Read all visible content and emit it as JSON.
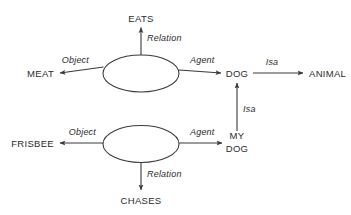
{
  "diagram": {
    "type": "semantic-network",
    "title": "",
    "background_color": "#ffffff",
    "line_color": "#3a3a3a",
    "text_color": "#2b2b2b",
    "nodes": [
      {
        "id": "eats",
        "label": "EATS",
        "kind": "concept",
        "x": 141,
        "y": 18
      },
      {
        "id": "meat",
        "label": "MEAT",
        "kind": "concept",
        "x": 40,
        "y": 73
      },
      {
        "id": "prop1",
        "label": "",
        "kind": "proposition",
        "x": 141,
        "y": 73
      },
      {
        "id": "dog",
        "label": "DOG",
        "kind": "concept",
        "x": 237,
        "y": 73
      },
      {
        "id": "animal",
        "label": "ANIMAL",
        "kind": "concept",
        "x": 322,
        "y": 73
      },
      {
        "id": "frisbee",
        "label": "FRISBEE",
        "kind": "concept",
        "x": 40,
        "y": 144
      },
      {
        "id": "prop2",
        "label": "",
        "kind": "proposition",
        "x": 141,
        "y": 144
      },
      {
        "id": "mydog",
        "label": "MY DOG",
        "kind": "concept",
        "x": 237,
        "y": 144,
        "line1": "MY",
        "line2": "DOG"
      },
      {
        "id": "chases",
        "label": "CHASES",
        "kind": "concept",
        "x": 141,
        "y": 200
      }
    ],
    "edges": [
      {
        "id": "e1",
        "label": "Relation",
        "from": "prop1",
        "to": "eats"
      },
      {
        "id": "e2",
        "label": "Object",
        "from": "prop1",
        "to": "meat"
      },
      {
        "id": "e3",
        "label": "Agent",
        "from": "prop1",
        "to": "dog"
      },
      {
        "id": "e4",
        "label": "Isa",
        "from": "dog",
        "to": "animal"
      },
      {
        "id": "e5",
        "label": "Isa",
        "from": "mydog",
        "to": "dog"
      },
      {
        "id": "e6",
        "label": "Object",
        "from": "prop2",
        "to": "frisbee"
      },
      {
        "id": "e7",
        "label": "Agent",
        "from": "prop2",
        "to": "mydog"
      },
      {
        "id": "e8",
        "label": "Relation",
        "from": "prop2",
        "to": "chases"
      }
    ]
  }
}
